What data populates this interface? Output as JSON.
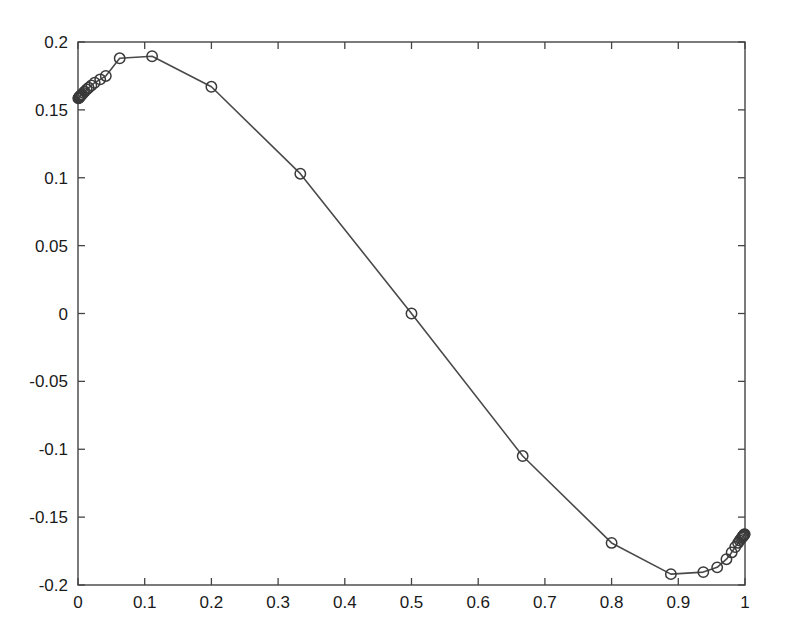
{
  "chart_data": {
    "type": "line",
    "title": "",
    "subtitle": "",
    "xlabel": "",
    "ylabel": "",
    "xlim": [
      0,
      1
    ],
    "ylim": [
      -0.2,
      0.2
    ],
    "grid": false,
    "legend": null,
    "marker": "circle-open",
    "line_color": "#4a4a4a",
    "marker_color": "#3a3a3a",
    "background_color": "#ffffff",
    "axis_color": "#444444",
    "xticks": [
      0,
      0.1,
      0.2,
      0.3,
      0.4,
      0.5,
      0.6,
      0.7,
      0.8,
      0.9,
      1
    ],
    "xtick_labels": [
      "0",
      "0.1",
      "0.2",
      "0.3",
      "0.4",
      "0.5",
      "0.6",
      "0.7",
      "0.8",
      "0.9",
      "1"
    ],
    "yticks": [
      0.2,
      0.15,
      0.1,
      0.05,
      0,
      -0.05,
      -0.1,
      -0.15,
      -0.2
    ],
    "ytick_labels": [
      "0.2",
      "0.15",
      "0.1",
      "0.05",
      "0",
      "-0.05",
      "-0.1",
      "-0.15",
      "-0.2"
    ],
    "series": [
      {
        "name": "curve",
        "x": [
          0.0005,
          0.001,
          0.0015,
          0.002,
          0.0025,
          0.003,
          0.004,
          0.005,
          0.006,
          0.008,
          0.01,
          0.013,
          0.016,
          0.02,
          0.025,
          0.0333,
          0.0417,
          0.0625,
          0.1111,
          0.2,
          0.3333,
          0.5,
          0.6667,
          0.8,
          0.8889,
          0.9375,
          0.9583,
          0.9722,
          0.98,
          0.9853,
          0.9896,
          0.992,
          0.994,
          0.9955,
          0.9965,
          0.9975,
          0.9983,
          0.999,
          0.9995
        ],
        "y": [
          0.1585,
          0.1588,
          0.159,
          0.1593,
          0.1596,
          0.16,
          0.1605,
          0.161,
          0.1615,
          0.1625,
          0.1635,
          0.165,
          0.1663,
          0.168,
          0.17,
          0.1725,
          0.175,
          0.188,
          0.1895,
          0.167,
          0.103,
          0.0,
          -0.105,
          -0.169,
          -0.192,
          -0.1905,
          -0.187,
          -0.181,
          -0.176,
          -0.172,
          -0.169,
          -0.1672,
          -0.166,
          -0.165,
          -0.1643,
          -0.1637,
          -0.1632,
          -0.1628,
          -0.1625
        ]
      }
    ]
  }
}
